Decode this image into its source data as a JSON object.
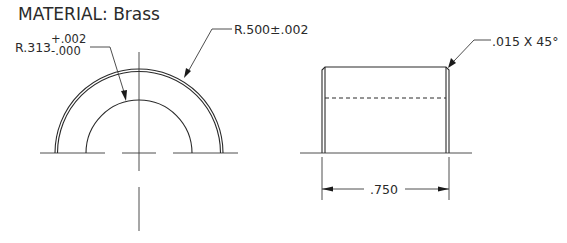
{
  "drawing": {
    "material_label": "MATERIAL: Brass",
    "front_view": {
      "inner_radius": {
        "prefix": "R.313",
        "upper_tolerance": "+.002",
        "lower_tolerance": "-.000"
      },
      "outer_radius": {
        "label": "R.500±.002"
      }
    },
    "side_view": {
      "chamfer": {
        "label": ".015 X 45°"
      },
      "length": {
        "label": ".750"
      }
    }
  }
}
